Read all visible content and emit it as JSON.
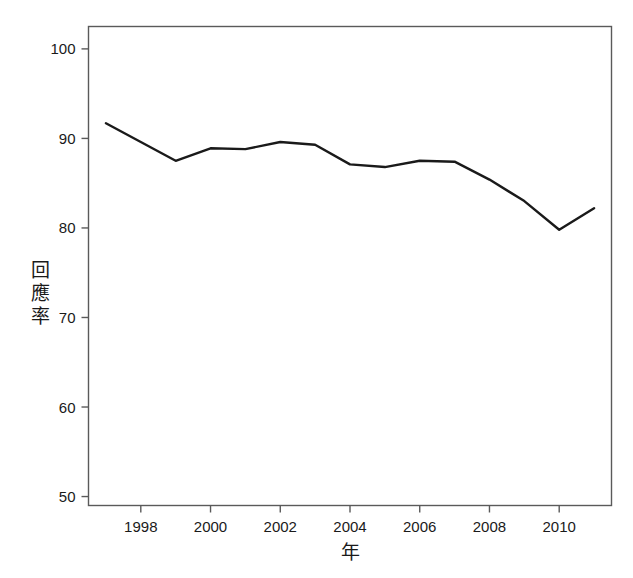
{
  "chart_data": {
    "type": "line",
    "title": "",
    "subtitle": "",
    "xlabel": "年",
    "ylabel": "回應率",
    "x": [
      1997,
      1998,
      1999,
      2000,
      2001,
      2002,
      2003,
      2004,
      2005,
      2006,
      2007,
      2008,
      2009,
      2010,
      2011
    ],
    "values": [
      91.7,
      89.6,
      87.5,
      88.9,
      88.8,
      89.6,
      89.3,
      87.1,
      86.8,
      87.5,
      87.4,
      85.4,
      83.0,
      79.8,
      82.2
    ],
    "series": [
      {
        "name": "回應率",
        "values": [
          91.7,
          89.6,
          87.5,
          88.9,
          88.8,
          89.6,
          89.3,
          87.1,
          86.8,
          87.5,
          87.4,
          85.4,
          83.0,
          79.8,
          82.2
        ]
      }
    ],
    "xlim": [
      1996.5,
      2011.5
    ],
    "ylim": [
      49.0,
      102.5
    ],
    "xticks": [
      1998,
      2000,
      2002,
      2004,
      2006,
      2008,
      2010
    ],
    "xticklabels": [
      "1998",
      "2000",
      "2002",
      "2004",
      "2006",
      "2008",
      "2010"
    ],
    "yticks": [
      50,
      60,
      70,
      80,
      90,
      100
    ],
    "yticklabels": [
      "50",
      "60",
      "70",
      "80",
      "90",
      "100"
    ],
    "grid": false,
    "legend": false,
    "line_color": "#1a1a1a",
    "line_width": 2.4,
    "frame_color": "#5a5a5a",
    "background": "#ffffff"
  },
  "axes": {
    "y_label_chars": [
      "回",
      "應",
      "率"
    ],
    "x_label": "年"
  },
  "colors": {
    "line": "#1a1a1a",
    "frame": "#6b6b6b",
    "text": "#1a1a1a",
    "background": "#ffffff"
  }
}
